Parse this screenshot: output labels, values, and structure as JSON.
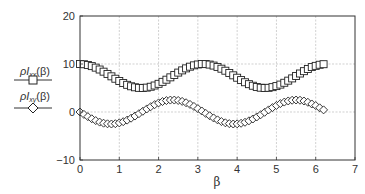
{
  "chart_data": {
    "type": "scatter",
    "title": "",
    "xlabel": "β",
    "ylabel": "",
    "xlim": [
      0,
      7
    ],
    "ylim": [
      -10,
      20
    ],
    "xticks": [
      0,
      1,
      2,
      3,
      4,
      5,
      6,
      7
    ],
    "yticks": [
      -10,
      0,
      10,
      20
    ],
    "xtick_labels": [
      "0",
      "1",
      "2",
      "3",
      "4",
      "5",
      "6",
      "7"
    ],
    "ytick_labels": [
      "−10",
      "0",
      "10",
      "20"
    ],
    "grid": true,
    "legend_position": "left-outside",
    "x": [
      0,
      0.1,
      0.2,
      0.3,
      0.4,
      0.5,
      0.6,
      0.7,
      0.8,
      0.9,
      1.0,
      1.1,
      1.2,
      1.3,
      1.4,
      1.5,
      1.6,
      1.7,
      1.8,
      1.9,
      2.0,
      2.1,
      2.2,
      2.3,
      2.4,
      2.5,
      2.6,
      2.7,
      2.8,
      2.9,
      3.0,
      3.1,
      3.2,
      3.3,
      3.4,
      3.5,
      3.6,
      3.7,
      3.8,
      3.9,
      4.0,
      4.1,
      4.2,
      4.3,
      4.4,
      4.5,
      4.6,
      4.7,
      4.8,
      4.9,
      5.0,
      5.1,
      5.2,
      5.3,
      5.4,
      5.5,
      5.6,
      5.7,
      5.8,
      5.9,
      6.0,
      6.1,
      6.2
    ],
    "series": [
      {
        "name": "ρI_xx(β)",
        "legend_main": "ρI",
        "legend_sub": "xx",
        "legend_tail": "(β)",
        "marker": "square",
        "values": [
          10.0,
          9.95,
          9.8,
          9.56,
          9.24,
          8.85,
          8.4,
          7.93,
          7.43,
          6.93,
          6.46,
          6.03,
          5.66,
          5.36,
          5.15,
          5.03,
          5.0,
          5.08,
          5.26,
          5.52,
          5.87,
          6.28,
          6.73,
          7.22,
          7.72,
          8.21,
          8.67,
          9.09,
          9.44,
          9.72,
          9.9,
          9.99,
          9.98,
          9.88,
          9.67,
          9.39,
          9.02,
          8.6,
          8.13,
          7.64,
          7.14,
          6.65,
          6.2,
          5.8,
          5.47,
          5.22,
          5.06,
          5.0,
          5.04,
          5.18,
          5.4,
          5.71,
          6.09,
          6.53,
          7.0,
          7.51,
          8.02,
          8.51,
          8.96,
          9.36,
          9.61,
          9.84,
          9.96
        ]
      },
      {
        "name": "ρI_xy(β)",
        "legend_main": "ρI",
        "legend_sub": "xy",
        "legend_tail": "(β)",
        "marker": "diamond",
        "values": [
          0.0,
          -0.5,
          -0.97,
          -1.41,
          -1.79,
          -2.1,
          -2.33,
          -2.46,
          -2.5,
          -2.44,
          -2.27,
          -2.02,
          -1.69,
          -1.29,
          -0.84,
          -0.35,
          0.15,
          0.64,
          1.11,
          1.53,
          1.89,
          2.18,
          2.38,
          2.49,
          2.49,
          2.4,
          2.21,
          1.93,
          1.58,
          1.16,
          0.7,
          0.21,
          -0.29,
          -0.78,
          -1.24,
          -1.64,
          -1.99,
          -2.25,
          -2.42,
          -2.5,
          -2.47,
          -2.35,
          -2.14,
          -1.84,
          -1.46,
          -1.03,
          -0.56,
          -0.06,
          0.44,
          0.92,
          1.36,
          1.75,
          2.07,
          2.3,
          2.45,
          2.5,
          2.45,
          2.29,
          2.03,
          1.67,
          1.34,
          0.87,
          0.44
        ]
      }
    ]
  },
  "colors": {
    "axis": "#333333",
    "grid": "#bbbbbb",
    "marker_stroke": "#222222",
    "marker_fill": "#ffffff",
    "background": "#ffffff"
  }
}
